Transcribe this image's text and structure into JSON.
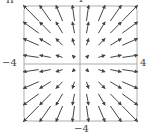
{
  "panel_label": "II",
  "axis_labels": {
    "top": "4",
    "bottom": "−4",
    "left": "−4",
    "right": "4"
  },
  "field": {
    "description": "Radial outward vector field F(x,y) = (x, y)",
    "grid_values": [
      -3.5,
      -2.5,
      -1.5,
      -0.5,
      0.5,
      1.5,
      2.5,
      3.5
    ],
    "xrange": [
      -4,
      4
    ],
    "yrange": [
      -4,
      4
    ],
    "arrow_color": "#444444",
    "frame_color": "#888888"
  }
}
